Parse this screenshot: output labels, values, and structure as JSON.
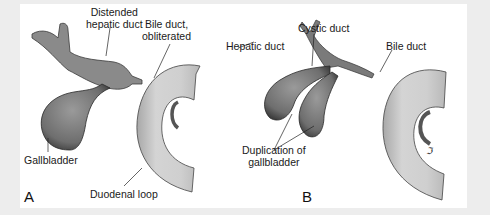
{
  "figure": {
    "panels": [
      {
        "id": "A",
        "letter": "A",
        "labels": {
          "distended_hepatic_duct_l1": "Distended",
          "distended_hepatic_duct_l2": "hepatic duct",
          "bile_duct_l1": "Bile duct,",
          "bile_duct_l2": "obliterated",
          "gallbladder": "Gallbladder",
          "duodenal_loop": "Duodenal loop"
        }
      },
      {
        "id": "B",
        "letter": "B",
        "labels": {
          "hepatic_duct": "Hepatic duct",
          "cystic_duct": "Cystic duct",
          "bile_duct": "Bile duct",
          "duplication_l1": "Duplication of",
          "duplication_l2": "gallbladder"
        }
      }
    ],
    "colors": {
      "background": "#ededed",
      "panel": "#ffffff",
      "organ_dark": "#7a7a7a",
      "duodenum": "#c8c8c8"
    }
  }
}
